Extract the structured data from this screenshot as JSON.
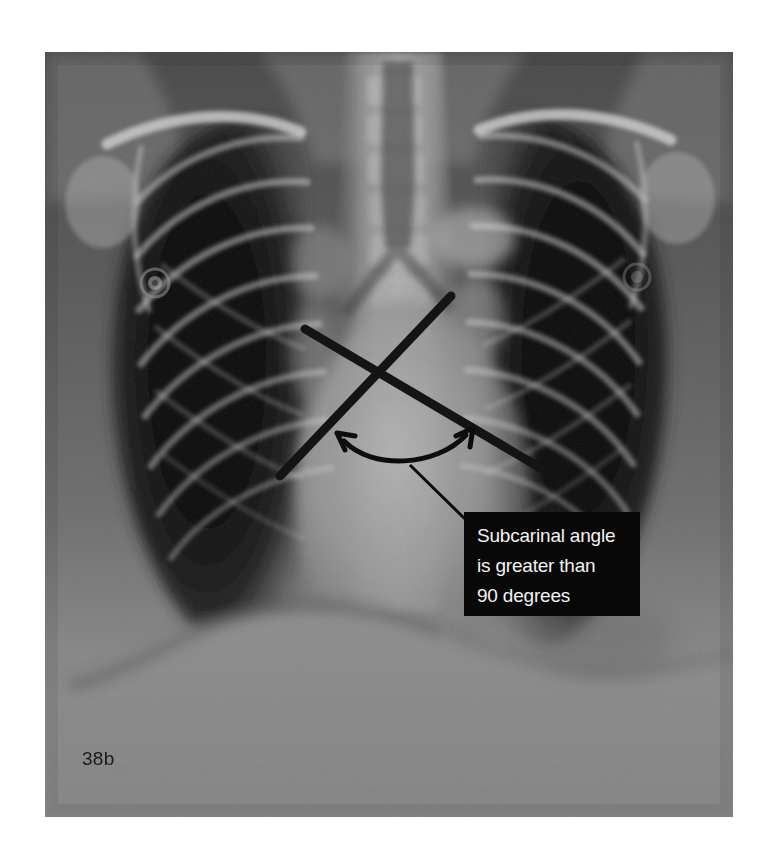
{
  "figure": {
    "label": "38b",
    "modality": "chest-radiograph",
    "view": "frontal-pa",
    "finding": "widened subcarinal angle"
  },
  "callout": {
    "lines": [
      "Subcarinal angle",
      "is greater than",
      "90 degrees"
    ],
    "background_color": "#080808",
    "text_color": "#f2f2f2"
  },
  "annotations": {
    "measurement_lines": [
      {
        "name": "left-main-bronchus-line",
        "x1": 280,
        "y1": 476,
        "x2": 451,
        "y2": 296,
        "stroke": "#141414",
        "width": 9
      },
      {
        "name": "right-main-bronchus-line",
        "x1": 305,
        "y1": 329,
        "x2": 559,
        "y2": 479,
        "stroke": "#141414",
        "width": 9
      }
    ],
    "angle_arc": {
      "name": "subcarinal-angle-arc",
      "start_x": 339,
      "start_y": 440,
      "end_x": 470,
      "end_y": 432,
      "stroke": "#0d0d0d",
      "width": 5,
      "arrowheads": 2
    },
    "leader_line": {
      "name": "callout-leader-line",
      "points": "408,468 464,521 560,521",
      "stroke": "#0d0d0d",
      "width": 3
    },
    "electrodes": [
      {
        "name": "ecg-electrode-left",
        "cx": 155,
        "cy": 283,
        "r": 13
      },
      {
        "name": "ecg-electrode-right",
        "cx": 637,
        "cy": 277,
        "r": 12
      }
    ]
  },
  "image_frame": {
    "left": 45,
    "top": 52,
    "width": 688,
    "height": 765,
    "background": "#6d6d6d"
  }
}
